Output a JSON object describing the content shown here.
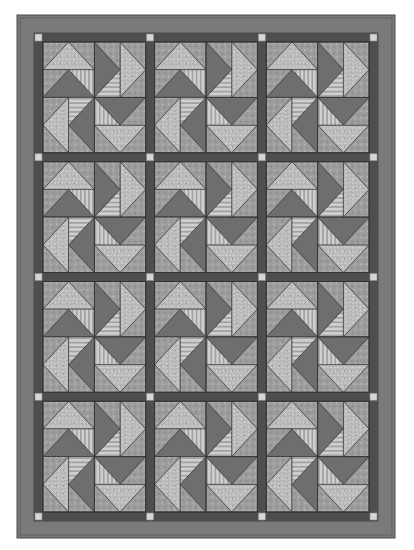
{
  "layout": {
    "columns": 3,
    "rows": 4
  },
  "colors": {
    "background": "#ffffff",
    "outer_border": "#7a7a7a",
    "outer_border_line": "#4a4a4a",
    "sashing": "#4e4e4e",
    "cornerstone": "#d6d6d6",
    "dark_geese": "#6e6e6e",
    "light_print": "#b4b4b4",
    "medium_print": "#9a9a9a",
    "stripe_light": "#cfcfcf",
    "stripe_dark": "#a6a6a6",
    "seam": "#333333"
  },
  "blocks": [
    {
      "row": 0,
      "col": 0
    },
    {
      "row": 0,
      "col": 1
    },
    {
      "row": 0,
      "col": 2
    },
    {
      "row": 1,
      "col": 0
    },
    {
      "row": 1,
      "col": 1
    },
    {
      "row": 1,
      "col": 2
    },
    {
      "row": 2,
      "col": 0
    },
    {
      "row": 2,
      "col": 1
    },
    {
      "row": 2,
      "col": 2
    },
    {
      "row": 3,
      "col": 0
    },
    {
      "row": 3,
      "col": 1
    },
    {
      "row": 3,
      "col": 2
    }
  ]
}
